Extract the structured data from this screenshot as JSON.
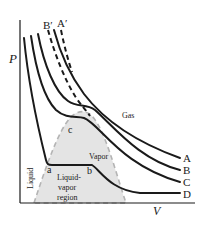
{
  "diagram": {
    "axes": {
      "y_label": "P",
      "x_label": "V"
    },
    "isotherm_labels": {
      "A": "A",
      "B": "B",
      "C": "C",
      "D": "D",
      "A_prime": "A′",
      "B_prime": "B′"
    },
    "point_labels": {
      "a": "a",
      "b": "b",
      "c": "c"
    },
    "region_labels": {
      "gas": "Gas",
      "vapor": "Vapor",
      "liquid": "Liquid",
      "liquid_vapor_line1": "Liquid-",
      "liquid_vapor_line2": "vapor",
      "liquid_vapor_line3": "region"
    },
    "colors": {
      "line": "#1a1a1a",
      "region_fill": "#e4e4e4",
      "region_border": "#b4b4b4"
    }
  }
}
